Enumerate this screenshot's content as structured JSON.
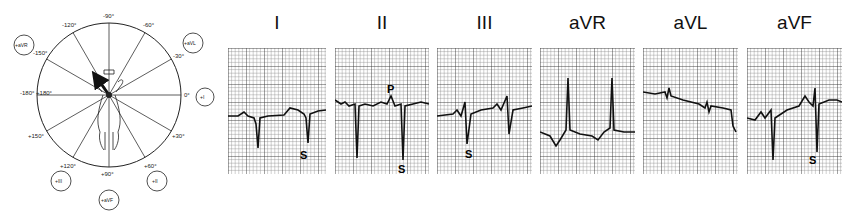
{
  "hexaxial": {
    "angle_labels": [
      "-90°",
      "-60°",
      "-30°",
      "0°",
      "+30°",
      "+60°",
      "+90°",
      "+120°",
      "+150°",
      "-180° +180°",
      "-150°",
      "-120°"
    ],
    "lead_badges": [
      {
        "id": "avr",
        "label": "+aVR"
      },
      {
        "id": "avl",
        "label": "+aVL"
      },
      {
        "id": "i",
        "label": "+I"
      },
      {
        "id": "ii",
        "label": "+II"
      },
      {
        "id": "avf",
        "label": "+aVF"
      },
      {
        "id": "iii",
        "label": "+III"
      }
    ]
  },
  "leads": [
    {
      "name": "I",
      "wave_annotations": [
        "S"
      ]
    },
    {
      "name": "II",
      "wave_annotations": [
        "P",
        "S"
      ]
    },
    {
      "name": "III",
      "wave_annotations": [
        "S"
      ]
    },
    {
      "name": "aVR",
      "wave_annotations": []
    },
    {
      "name": "aVL",
      "wave_annotations": []
    },
    {
      "name": "aVF",
      "wave_annotations": [
        "S"
      ]
    }
  ]
}
